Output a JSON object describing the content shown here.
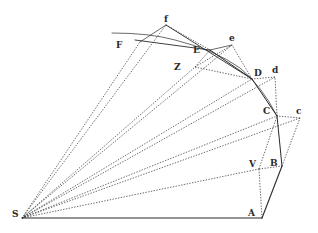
{
  "figure": {
    "type": "geometric-diagram",
    "ink_color": "#2a2a2a",
    "points": {
      "S": {
        "x": 22,
        "y": 218
      },
      "A": {
        "x": 262,
        "y": 218
      },
      "B": {
        "x": 282,
        "y": 166
      },
      "V": {
        "x": 259,
        "y": 169
      },
      "C": {
        "x": 277,
        "y": 116
      },
      "c": {
        "x": 300,
        "y": 118
      },
      "D": {
        "x": 252,
        "y": 79
      },
      "d": {
        "x": 275,
        "y": 77
      },
      "E": {
        "x": 210,
        "y": 50
      },
      "e": {
        "x": 232,
        "y": 45
      },
      "Z": {
        "x": 195,
        "y": 67
      },
      "f": {
        "x": 166,
        "y": 25
      },
      "F": {
        "x": 135,
        "y": 40
      }
    },
    "labels": [
      {
        "id": "S",
        "text": "S",
        "x": 12,
        "y": 210
      },
      {
        "id": "A",
        "text": "A",
        "x": 248,
        "y": 209
      },
      {
        "id": "V",
        "text": "V",
        "x": 249,
        "y": 160
      },
      {
        "id": "B",
        "text": "B",
        "x": 270,
        "y": 159
      },
      {
        "id": "C",
        "text": "C",
        "x": 263,
        "y": 107
      },
      {
        "id": "c",
        "text": "c",
        "x": 296,
        "y": 107
      },
      {
        "id": "D",
        "text": "D",
        "x": 254,
        "y": 69
      },
      {
        "id": "d",
        "text": "d",
        "x": 272,
        "y": 66
      },
      {
        "id": "E",
        "text": "E",
        "x": 193,
        "y": 46
      },
      {
        "id": "e",
        "text": "e",
        "x": 229,
        "y": 34
      },
      {
        "id": "Z",
        "text": "Z",
        "x": 174,
        "y": 63
      },
      {
        "id": "f",
        "text": "f",
        "x": 164,
        "y": 15
      },
      {
        "id": "F",
        "text": "F",
        "x": 116,
        "y": 41
      }
    ]
  }
}
